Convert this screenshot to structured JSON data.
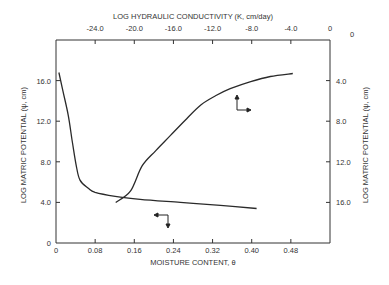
{
  "chart_data": {
    "type": "line",
    "title": "",
    "xlabel": "MOISTURE CONTENT, θ",
    "x2label": "LOG HYDRAULIC CONDUCTIVITY (K, cm/day)",
    "ylabel": "LOG MATRIC POTENTIAL (ψ, cm)",
    "y2label": "LOG MATRIC POTENTIAL (ψ, cm)",
    "xlim": [
      0,
      0.56
    ],
    "x2lim": [
      -28.0,
      0
    ],
    "ylim": [
      0,
      20.0
    ],
    "y2lim": [
      20.0,
      0
    ],
    "x_ticks": [
      "0",
      "0.08",
      "0.16",
      "0.24",
      "0.32",
      "0.40",
      "0.48"
    ],
    "x_tick_values": [
      0,
      0.08,
      0.16,
      0.24,
      0.32,
      0.4,
      0.48
    ],
    "x2_ticks": [
      "-24.0",
      "-20.0",
      "-16.0",
      "-12.0",
      "-8.0",
      "-4.0",
      "0"
    ],
    "x2_tick_values": [
      -24,
      -20,
      -16,
      -12,
      -8,
      -4,
      0
    ],
    "y_ticks": [
      "0",
      "4.0",
      "8.0",
      "12.0",
      "16.0"
    ],
    "y_tick_values": [
      0,
      4,
      8,
      12,
      16
    ],
    "y2_ticks": [
      "0",
      "4.0",
      "8.0",
      "12.0",
      "16.0"
    ],
    "y2_tick_values": [
      0,
      4,
      8,
      12,
      16
    ],
    "grid": false,
    "legend": "arrow symbols indicate axes for each curve",
    "series": [
      {
        "name": "Moisture retention (ψ vs θ) — bottom & left axes",
        "axes": "bottom-left",
        "x": [
          0.006,
          0.014,
          0.025,
          0.033,
          0.041,
          0.049,
          0.066,
          0.08,
          0.121,
          0.172,
          0.254,
          0.336,
          0.41
        ],
        "y": [
          16.8,
          15.0,
          12.6,
          10.1,
          7.7,
          6.2,
          5.4,
          5.0,
          4.6,
          4.3,
          4.0,
          3.7,
          3.4
        ]
      },
      {
        "name": "Hydraulic conductivity (ψ vs log K) — top & right axes",
        "axes": "top-right",
        "x": [
          -21.9,
          -20.4,
          -19.2,
          -17.8,
          -16.3,
          -14.8,
          -13.2,
          -11.7,
          -10.2,
          -8.1,
          -6.1,
          -3.8
        ],
        "y": [
          16.0,
          14.9,
          12.4,
          10.9,
          9.4,
          7.9,
          6.4,
          5.5,
          4.8,
          4.1,
          3.6,
          3.3
        ]
      }
    ]
  },
  "labels": {
    "top_axis_title": "LOG HYDRAULIC CONDUCTIVITY (K, cm/day)",
    "bottom_axis_title": "MOISTURE CONTENT, θ",
    "left_axis_title": "LOG MATRIC POTENTIAL (ψ, cm)",
    "right_axis_title": "LOG MATRIC POTENTIAL (ψ, cm)",
    "corner_top_right": "0",
    "corner_right_top": "0"
  },
  "style": {
    "line_color": "#2a2a2a",
    "axis_color": "#333333",
    "background": "#ffffff"
  }
}
